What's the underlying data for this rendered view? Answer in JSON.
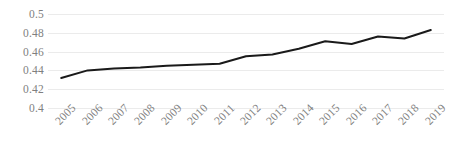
{
  "chart_data": {
    "type": "line",
    "title": "",
    "subtitle": "",
    "xlabel": "",
    "ylabel": "",
    "categories": [
      "2005",
      "2006",
      "2007",
      "2008",
      "2009",
      "2010",
      "2011",
      "2012",
      "2013",
      "2014",
      "2015",
      "2016",
      "2017",
      "2018",
      "2019"
    ],
    "values": [
      0.432,
      0.44,
      0.442,
      0.443,
      0.445,
      0.446,
      0.447,
      0.455,
      0.457,
      0.463,
      0.471,
      0.468,
      0.476,
      0.474,
      0.483
    ],
    "series": [
      {
        "name": "",
        "values": [
          0.432,
          0.44,
          0.442,
          0.443,
          0.445,
          0.446,
          0.447,
          0.455,
          0.457,
          0.463,
          0.471,
          0.468,
          0.476,
          0.474,
          0.483
        ]
      }
    ],
    "ylim": [
      0.4,
      0.5
    ],
    "xlim": [
      "2005",
      "2019"
    ],
    "y_ticks": [
      0.5,
      0.48,
      0.46,
      0.44,
      0.42,
      0.4
    ],
    "y_tick_labels": [
      "0.5",
      "0.48",
      "0.46",
      "0.44",
      "0.42",
      "0.4"
    ],
    "x_tick_labels": [
      "2005",
      "2006",
      "2007",
      "2008",
      "2009",
      "2010",
      "2011",
      "2012",
      "2013",
      "2014",
      "2015",
      "2016",
      "2017",
      "2018",
      "2019"
    ],
    "x_tick_rotation": -45,
    "grid": "horizontal",
    "legend": "none",
    "line_color": "#1a1a1a",
    "line_width": 2,
    "markers": "none",
    "grid_color": "#ebebeb",
    "tick_label_color": "#7f7f7f",
    "background_color": "#ffffff",
    "annotations": []
  },
  "axes": {
    "y_ticks": [
      {
        "label": "0.5",
        "value": 0.5
      },
      {
        "label": "0.48",
        "value": 0.48
      },
      {
        "label": "0.46",
        "value": 0.46
      },
      {
        "label": "0.44",
        "value": 0.44
      },
      {
        "label": "0.42",
        "value": 0.42
      },
      {
        "label": "0.4",
        "value": 0.4
      }
    ]
  }
}
